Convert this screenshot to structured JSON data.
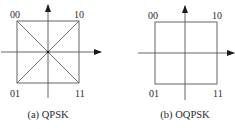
{
  "diagrams": [
    {
      "id": "qpsk",
      "caption": "(a) QPSK",
      "has_diagonals": true,
      "points": {
        "top_left": "00",
        "top_right": "10",
        "bottom_left": "01",
        "bottom_right": "11"
      }
    },
    {
      "id": "oqpsk",
      "caption": "(b) OQPSK",
      "has_diagonals": false,
      "points": {
        "top_left": "00",
        "top_right": "10",
        "bottom_left": "01",
        "bottom_right": "11"
      }
    }
  ],
  "colors": {
    "line": "#555555",
    "text": "#2a2a2a",
    "background": "#ffffff"
  }
}
